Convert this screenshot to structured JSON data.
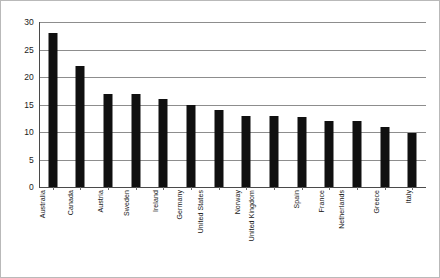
{
  "chart_data": {
    "type": "bar",
    "title": "",
    "subtitle": "",
    "xlabel": "",
    "ylabel": "",
    "ylim": [
      0,
      30
    ],
    "ytick_step": 5,
    "yticks": [
      0,
      5,
      10,
      15,
      20,
      25,
      30
    ],
    "grid": true,
    "grid_axis": "y",
    "legend": false,
    "legend_position": "none",
    "orientation": "vertical",
    "bar_color": "#101010",
    "gridline_color": "#8d8d8d",
    "axis_color": "#4a4a4a",
    "categories": [
      "Australia",
      "Canada",
      "Austria",
      "Sweden",
      "Ireland",
      "Germany",
      "United States",
      "Norway",
      "United Kingdom",
      "Spain",
      "France",
      "Netherlands",
      "Greece",
      "Italy"
    ],
    "values": [
      28,
      22,
      17,
      17,
      16,
      15,
      14,
      13,
      13,
      12.7,
      12,
      12,
      11,
      9.8
    ],
    "series": [
      {
        "name": "",
        "values": [
          28,
          22,
          17,
          17,
          16,
          15,
          14,
          13,
          13,
          12.7,
          12,
          12,
          11,
          9.8
        ]
      }
    ]
  }
}
